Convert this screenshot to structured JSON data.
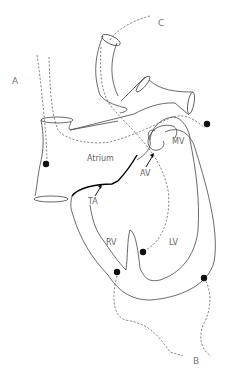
{
  "diagram": {
    "type": "heart-anatomy-line-drawing",
    "labels": {
      "A": "A",
      "B": "B",
      "C": "C",
      "atrium": "Atrium",
      "mv": "MV",
      "av": "AV",
      "ta": "TA",
      "rv": "RV",
      "lv": "LV"
    }
  }
}
